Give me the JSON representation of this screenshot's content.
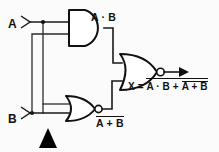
{
  "diagram": {
    "background_color": "#fbfbfb",
    "line_color": "#111111"
  },
  "inputs": [
    {
      "id": "input-a",
      "label": "A",
      "terminal": "arrow-terminal"
    },
    {
      "id": "input-b",
      "label": "B",
      "terminal": "arrow-terminal"
    }
  ],
  "gates": [
    {
      "id": "and-gate-1",
      "type": "AND",
      "inputs": [
        "A",
        "B"
      ],
      "output_label": "A · B",
      "inverted": false
    },
    {
      "id": "nor-gate-1",
      "type": "NOR",
      "inputs": [
        "A",
        "B"
      ],
      "output_label_base": "A + B",
      "output_label_overbar": true,
      "inverted": true
    },
    {
      "id": "nor-gate-out",
      "type": "NOR",
      "inputs": [
        "A · B",
        "A + B"
      ],
      "inverted": true
    }
  ],
  "labels": {
    "and_output": "A · B",
    "nor_output_inner": "A + B",
    "output_prefix": "X =",
    "output_term1": "A · B",
    "output_plus": "+",
    "output_term2": "A + B"
  },
  "output": {
    "name": "X",
    "expression_plain": "X = NOT( A·B + NOT(A + B) )",
    "has_outer_overbar": true,
    "has_inner_overbar": true,
    "arrow": "right-arrow"
  },
  "annotations": {
    "cursor": {
      "name": "cursor-triangle",
      "shape": "filled-triangle",
      "color": "#000000"
    }
  }
}
